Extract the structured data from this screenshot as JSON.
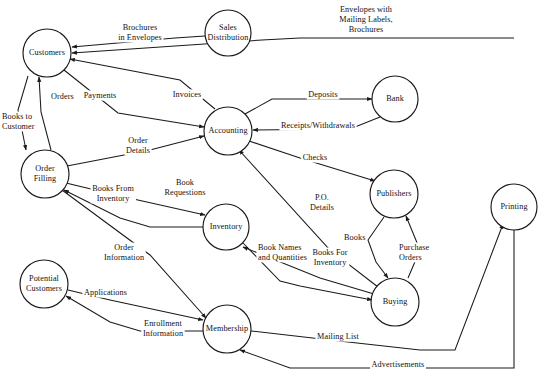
{
  "diagram": {
    "type": "data-flow-diagram",
    "width": 549,
    "height": 385,
    "background_color": "#ffffff",
    "line_color": "#1a1a1a",
    "text_color": "#111111",
    "nodes": [
      {
        "id": "customers",
        "label": "Customers",
        "lines": [
          "Customers"
        ],
        "cx": 47,
        "cy": 53,
        "r": 24
      },
      {
        "id": "sales-distribution",
        "label": "Sales Distribution",
        "lines": [
          "Sales",
          "Distribution"
        ],
        "cx": 228,
        "cy": 33,
        "r": 23
      },
      {
        "id": "accounting",
        "label": "Accounting",
        "lines": [
          "Accounting"
        ],
        "cx": 228,
        "cy": 131,
        "r": 24
      },
      {
        "id": "bank",
        "label": "Bank",
        "lines": [
          "Bank"
        ],
        "cx": 395,
        "cy": 99,
        "r": 23
      },
      {
        "id": "order-filling",
        "label": "Order Filling",
        "lines": [
          "Order",
          "Filling"
        ],
        "cx": 45,
        "cy": 174,
        "r": 24
      },
      {
        "id": "publishers",
        "label": "Publishers",
        "lines": [
          "Publishers"
        ],
        "cx": 394,
        "cy": 194,
        "r": 24
      },
      {
        "id": "printing",
        "label": "Printing",
        "lines": [
          "Printing"
        ],
        "cx": 514,
        "cy": 207,
        "r": 23
      },
      {
        "id": "inventory",
        "label": "Inventory",
        "lines": [
          "Inventory"
        ],
        "cx": 226,
        "cy": 227,
        "r": 23
      },
      {
        "id": "potential-customers",
        "label": "Potential Customers",
        "lines": [
          "Potential",
          "Customers"
        ],
        "cx": 44,
        "cy": 284,
        "r": 24
      },
      {
        "id": "buying",
        "label": "Buying",
        "lines": [
          "Buying"
        ],
        "cx": 395,
        "cy": 302,
        "r": 24
      },
      {
        "id": "membership",
        "label": "Membership",
        "lines": [
          "Membership"
        ],
        "cx": 227,
        "cy": 329,
        "r": 24
      }
    ],
    "flows": [
      {
        "id": "brochures-in-envelopes",
        "label": "Brochures in Envelopes",
        "lines": [
          "Brochures",
          "in Envelopes"
        ],
        "from": "sales-distribution",
        "to": "customers",
        "path": "M 205 36 L 175 38 L 72 47",
        "arrow_at": "end",
        "label_x": 140,
        "label_y": 35,
        "anchor": "mid"
      },
      {
        "id": "envelopes-with-mailing-labels-brochures",
        "label": "Envelopes with Mailing Labels, Brochures",
        "lines": [
          "Envelopes with",
          "Mailing Labels,",
          "Brochures"
        ],
        "from": "printing",
        "to": "customers",
        "path": "M 514 38 L 300 38 L 262 40 L 72 53",
        "arrow_at": "end",
        "label_x": 366,
        "label_y": 22,
        "anchor": "mid"
      },
      {
        "id": "payments",
        "label": "Payments",
        "lines": [
          "Payments"
        ],
        "from": "customers",
        "to": "accounting",
        "path": "M 64 70 L 118 113 L 204 127",
        "arrow_at": "end",
        "label_x": 100,
        "label_y": 98,
        "anchor": "mid"
      },
      {
        "id": "invoices",
        "label": "Invoices",
        "lines": [
          "Invoices"
        ],
        "from": "accounting",
        "to": "customers",
        "path": "M 215 109 L 180 80 L 70 59",
        "arrow_at": "end",
        "label_x": 187,
        "label_y": 97,
        "anchor": "mid"
      },
      {
        "id": "orders",
        "label": "Orders",
        "lines": [
          "Orders"
        ],
        "from": "order-filling",
        "to": "customers",
        "path": "M 51 150 L 41 112 L 39 77",
        "arrow_at": "end",
        "label_x": 51,
        "label_y": 99,
        "anchor": "start"
      },
      {
        "id": "books-to-customer",
        "label": "Books to Customer",
        "lines": [
          "Books to",
          "Customer"
        ],
        "from": "customers",
        "to": "order-filling",
        "path": "M 28 76 L 18 110 L 26 150",
        "arrow_at": "end",
        "label_x": 2,
        "label_y": 124,
        "anchor": "start"
      },
      {
        "id": "order-details",
        "label": "Order Details",
        "lines": [
          "Order",
          "Details"
        ],
        "from": "order-filling",
        "to": "accounting",
        "path": "M 67 166 L 150 150 L 204 136",
        "arrow_at": "end",
        "label_x": 138,
        "label_y": 148,
        "anchor": "mid"
      },
      {
        "id": "deposits",
        "label": "Deposits",
        "lines": [
          "Deposits"
        ],
        "from": "accounting",
        "to": "bank",
        "path": "M 245 114 L 272 99 L 372 99",
        "arrow_at": "end",
        "label_x": 323,
        "label_y": 97,
        "anchor": "mid"
      },
      {
        "id": "receipts-withdrawals",
        "label": "Receipts/Withdrawals",
        "lines": [
          "Receipts/Withdrawals"
        ],
        "from": "bank",
        "to": "accounting",
        "path": "M 380 117 L 350 129 L 253 130",
        "arrow_at": "end",
        "label_x": 318,
        "label_y": 128,
        "anchor": "mid"
      },
      {
        "id": "checks",
        "label": "Checks",
        "lines": [
          "Checks"
        ],
        "from": "accounting",
        "to": "publishers",
        "path": "M 249 141 L 300 158 L 375 181",
        "arrow_at": "end",
        "label_x": 315,
        "label_y": 160,
        "anchor": "mid"
      },
      {
        "id": "po-details",
        "label": "P.O. Details",
        "lines": [
          "P.O.",
          "Details"
        ],
        "from": "buying",
        "to": "accounting",
        "path": "M 378 287 L 330 250 L 239 150",
        "arrow_at": "end",
        "label_x": 322,
        "label_y": 205,
        "anchor": "mid"
      },
      {
        "id": "book-requestions",
        "label": "Book Requestions",
        "lines": [
          "Book",
          "Requestions"
        ],
        "from": "order-filling",
        "to": "inventory",
        "path": "M 66 183 L 120 196 L 205 215",
        "arrow_at": "end",
        "label_x": 185,
        "label_y": 190,
        "anchor": "mid"
      },
      {
        "id": "books-from-inventory",
        "label": "Books From Inventory",
        "lines": [
          "Books From",
          "Inventory"
        ],
        "from": "inventory",
        "to": "order-filling",
        "path": "M 203 227 L 150 227 L 120 218 L 64 190",
        "arrow_at": "end",
        "label_x": 113,
        "label_y": 196,
        "anchor": "mid"
      },
      {
        "id": "order-information",
        "label": "Order Information",
        "lines": [
          "Order",
          "Information"
        ],
        "from": "order-filling",
        "to": "membership",
        "path": "M 62 190 L 150 255 L 206 318",
        "arrow_at": "end",
        "label_x": 124,
        "label_y": 255,
        "anchor": "mid"
      },
      {
        "id": "book-names-and-quantities",
        "label": "Book Names and Quantities",
        "lines": [
          "Book Names",
          "and Quantities"
        ],
        "from": "inventory",
        "to": "buying",
        "path": "M 243 243 L 280 281 L 300 286 L 372 300",
        "arrow_at": "end",
        "label_x": 258,
        "label_y": 255,
        "anchor": "start"
      },
      {
        "id": "books-for-inventory",
        "label": "Books For Inventory",
        "lines": [
          "Books For",
          "Inventory"
        ],
        "from": "buying",
        "to": "inventory",
        "path": "M 374 294 L 320 278 L 243 247",
        "arrow_at": "end",
        "label_x": 330,
        "label_y": 260,
        "anchor": "mid"
      },
      {
        "id": "books",
        "label": "Books",
        "lines": [
          "Books"
        ],
        "from": "publishers",
        "to": "buying",
        "path": "M 384 217 L 368 240 L 376 262 L 388 278",
        "arrow_at": "end",
        "label_x": 344,
        "label_y": 240,
        "anchor": "start"
      },
      {
        "id": "purchase-orders",
        "label": "Purchase Orders",
        "lines": [
          "Purchase",
          "Orders"
        ],
        "from": "buying",
        "to": "publishers",
        "path": "M 408 278 L 420 250 L 406 216",
        "arrow_at": "end",
        "label_x": 399,
        "label_y": 255,
        "anchor": "start"
      },
      {
        "id": "applications",
        "label": "Applications",
        "lines": [
          "Applications"
        ],
        "from": "potential-customers",
        "to": "membership",
        "path": "M 68 290 L 110 300 L 203 320",
        "arrow_at": "end",
        "label_x": 84,
        "label_y": 295,
        "anchor": "start"
      },
      {
        "id": "enrollment-information",
        "label": "Enrollment Information",
        "lines": [
          "Enrollment",
          "Information"
        ],
        "from": "membership",
        "to": "potential-customers",
        "path": "M 203 331 L 140 331 L 110 322 L 66 296",
        "arrow_at": "end",
        "label_x": 163,
        "label_y": 331,
        "anchor": "mid"
      },
      {
        "id": "mailing-list",
        "label": "Mailing List",
        "lines": [
          "Mailing List"
        ],
        "from": "membership",
        "to": "printing",
        "path": "M 251 331 L 330 340 L 420 350 L 455 350 L 503 224",
        "arrow_at": "end",
        "label_x": 338,
        "label_y": 339,
        "anchor": "mid"
      },
      {
        "id": "advertisements",
        "label": "Advertisements",
        "lines": [
          "Advertisements"
        ],
        "from": "printing",
        "to": "membership",
        "path": "M 514 230 L 514 368 L 290 368 L 240 350",
        "arrow_at": "end",
        "label_x": 398,
        "label_y": 367,
        "anchor": "mid"
      }
    ]
  }
}
